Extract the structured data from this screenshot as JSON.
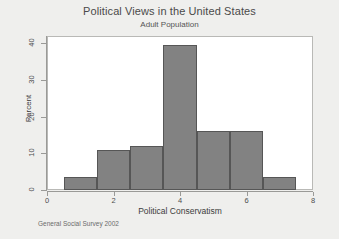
{
  "chart_data": {
    "type": "bar",
    "title": "Political Views in the United States",
    "subtitle": "Adult Population",
    "xlabel": "Political Conservatism",
    "ylabel": "Percent",
    "footnote": "General Social Survey 2002",
    "xlim": [
      0,
      8
    ],
    "ylim": [
      0,
      42
    ],
    "grid": false,
    "legend": null,
    "bar_fill_color": "#828282",
    "bar_border_color": "#565656",
    "plot_background": "#ffffff",
    "figure_background": "#efefed",
    "bin_edges": [
      0.5,
      1.5,
      2.5,
      3.5,
      4.5,
      5.5,
      6.5,
      7.5
    ],
    "categories": [
      "1",
      "2",
      "3",
      "4",
      "5",
      "6",
      "7"
    ],
    "values": [
      3.5,
      11,
      12,
      39.5,
      16,
      16,
      3.5
    ],
    "bars": [
      {
        "label": "1",
        "x_start": 0.5,
        "x_end": 1.5,
        "value": 3.5
      },
      {
        "label": "2",
        "x_start": 1.5,
        "x_end": 2.5,
        "value": 11
      },
      {
        "label": "3",
        "x_start": 2.5,
        "x_end": 3.5,
        "value": 12
      },
      {
        "label": "4",
        "x_start": 3.5,
        "x_end": 4.5,
        "value": 39.5
      },
      {
        "label": "5",
        "x_start": 4.5,
        "x_end": 5.5,
        "value": 16
      },
      {
        "label": "6",
        "x_start": 5.5,
        "x_end": 6.5,
        "value": 16
      },
      {
        "label": "7",
        "x_start": 6.5,
        "x_end": 7.5,
        "value": 3.5
      }
    ],
    "yticks": [
      0,
      10,
      20,
      30,
      40
    ],
    "ytick_labels": [
      "0",
      "10",
      "20",
      "30",
      "40"
    ],
    "xticks": [
      0,
      2,
      4,
      6,
      8
    ],
    "xtick_labels": [
      "0",
      "2",
      "4",
      "6",
      "8"
    ]
  }
}
